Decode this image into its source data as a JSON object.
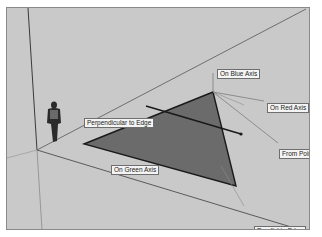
{
  "viewport": {
    "background": "#c9c9c9",
    "border": "#8a8a8a"
  },
  "scene": {
    "face_color": "#6b6b6b",
    "edge_color": "#1a1a1a",
    "axis_line_color": "#6a6a6a",
    "inference_line_color": "#7c7c7c",
    "figure": "person-figure"
  },
  "inference_labels": {
    "on_blue_axis": "On Blue Axis",
    "on_red_axis": "On Red Axis",
    "perpendicular_to_edge": "Perpendicular to Edge",
    "on_green_axis": "On Green Axis",
    "from_point": "From Point",
    "parallel_to_edge": "Parallel to Edge"
  }
}
